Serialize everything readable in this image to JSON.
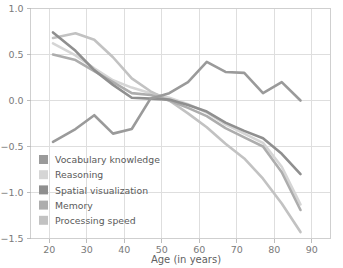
{
  "chart_data": {
    "type": "line",
    "title": "",
    "xlabel": "Age (in years)",
    "ylabel": "",
    "xlim": [
      15,
      95
    ],
    "ylim": [
      -1.5,
      1.0
    ],
    "xticks": [
      20,
      30,
      40,
      50,
      60,
      70,
      80,
      90
    ],
    "yticks": [
      1.0,
      0.5,
      0.0,
      -0.5,
      -1.0,
      -1.5
    ],
    "xtick_labels": [
      "20",
      "30",
      "40",
      "50",
      "60",
      "70",
      "80",
      "90"
    ],
    "ytick_labels": [
      "1.0",
      "0.5",
      "0.0",
      "-0.5",
      "-1.0",
      "-1.5"
    ],
    "grid": true,
    "grid_axis": "both",
    "legend_position": "lower-left-inset",
    "series": [
      {
        "name": "Vocabulary knowledge",
        "color": "#9a9a9a",
        "x": [
          21,
          27,
          32,
          37,
          42,
          47,
          52,
          57,
          62,
          67,
          72,
          77,
          82,
          87
        ],
        "values": [
          -0.45,
          -0.31,
          -0.16,
          -0.36,
          -0.31,
          0.02,
          0.08,
          0.2,
          0.42,
          0.31,
          0.3,
          0.08,
          0.2,
          0.0
        ]
      },
      {
        "name": "Reasoning",
        "color": "#d5d5d5",
        "x": [
          21,
          27,
          32,
          37,
          42,
          47,
          52,
          57,
          62,
          67,
          72,
          77,
          82,
          87
        ],
        "values": [
          0.62,
          0.49,
          0.35,
          0.22,
          0.14,
          0.08,
          0.03,
          -0.04,
          -0.13,
          -0.26,
          -0.36,
          -0.46,
          -0.72,
          -1.13
        ]
      },
      {
        "name": "Spatial visualization",
        "color": "#8f8f8f",
        "x": [
          21,
          27,
          32,
          37,
          42,
          47,
          52,
          57,
          62,
          67,
          72,
          77,
          82,
          87
        ],
        "values": [
          0.74,
          0.54,
          0.33,
          0.17,
          0.03,
          0.02,
          0.01,
          -0.05,
          -0.12,
          -0.24,
          -0.33,
          -0.41,
          -0.58,
          -0.8
        ]
      },
      {
        "name": "Memory",
        "color": "#adadad",
        "x": [
          21,
          27,
          32,
          37,
          42,
          47,
          52,
          57,
          62,
          67,
          72,
          77,
          82,
          87
        ],
        "values": [
          0.5,
          0.44,
          0.32,
          0.2,
          0.08,
          0.06,
          0.0,
          -0.08,
          -0.17,
          -0.3,
          -0.4,
          -0.5,
          -0.78,
          -1.19
        ]
      },
      {
        "name": "Processing speed",
        "color": "#c2c2c2",
        "x": [
          21,
          27,
          32,
          37,
          42,
          47,
          52,
          57,
          62,
          67,
          72,
          77,
          82,
          87
        ],
        "values": [
          0.68,
          0.73,
          0.66,
          0.47,
          0.24,
          0.1,
          0.0,
          -0.14,
          -0.29,
          -0.47,
          -0.63,
          -0.85,
          -1.12,
          -1.43
        ]
      }
    ]
  },
  "legend": {
    "items": [
      {
        "label": "Vocabulary knowledge",
        "color": "#9a9a9a"
      },
      {
        "label": "Reasoning",
        "color": "#d5d5d5"
      },
      {
        "label": "Spatial visualization",
        "color": "#8f8f8f"
      },
      {
        "label": "Memory",
        "color": "#adadad"
      },
      {
        "label": "Processing speed",
        "color": "#c2c2c2"
      }
    ]
  },
  "colors": {
    "grid": "#dedede",
    "frame": "#cfcfcf",
    "axis": "#bdbdbd",
    "text": "#6e6e6e",
    "background": "#ffffff"
  }
}
